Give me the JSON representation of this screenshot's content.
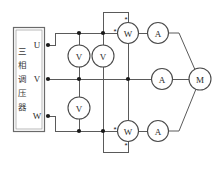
{
  "diagram": {
    "source_box": {
      "name": "three-phase-voltage-regulator",
      "label_vertical": "三相调压器",
      "characters": [
        "三",
        "相",
        "调",
        "压",
        "器"
      ],
      "terminals": [
        {
          "label": "U",
          "name": "terminal-u"
        },
        {
          "label": "V",
          "name": "terminal-v"
        },
        {
          "label": "W",
          "name": "terminal-w"
        }
      ]
    },
    "meters": [
      {
        "id": "voltmeter-1",
        "label": "V",
        "type": "voltmeter"
      },
      {
        "id": "voltmeter-2",
        "label": "V",
        "type": "voltmeter"
      },
      {
        "id": "voltmeter-3",
        "label": "V",
        "type": "voltmeter"
      },
      {
        "id": "wattmeter-top",
        "label": "W",
        "type": "wattmeter"
      },
      {
        "id": "wattmeter-bottom",
        "label": "W",
        "type": "wattmeter"
      },
      {
        "id": "ammeter-top",
        "label": "A",
        "type": "ammeter"
      },
      {
        "id": "ammeter-middle",
        "label": "A",
        "type": "ammeter"
      },
      {
        "id": "ammeter-bottom",
        "label": "A",
        "type": "ammeter"
      },
      {
        "id": "motor",
        "label": "M",
        "type": "motor"
      }
    ],
    "polarity_marks": [
      {
        "id": "wattmeter-top-current-mark",
        "symbol": "*"
      },
      {
        "id": "wattmeter-top-voltage-mark",
        "symbol": "*"
      },
      {
        "id": "wattmeter-bottom-current-mark",
        "symbol": "*"
      },
      {
        "id": "wattmeter-bottom-voltage-mark",
        "symbol": "*"
      }
    ],
    "colors": {
      "wire": "#5a5a5a",
      "meter_outline": "#4a4a4a",
      "node": "#1a1a1a",
      "background": "#ffffff",
      "text": "#2a2a2a"
    }
  }
}
